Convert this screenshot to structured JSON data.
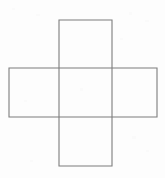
{
  "figure": {
    "background_color": "#fdfdfd",
    "stroke_color": "#7d7d7d",
    "stroke_width": 1.1,
    "canvas": {
      "width": 165,
      "height": 178
    }
  },
  "chart_data": {
    "type": "diagram",
    "title": "",
    "shape": "cross",
    "units": "pixels",
    "shapes": [
      {
        "name": "vertical-bar-rectangle",
        "label": "Vertical arm of cross",
        "x": 59,
        "y": 20,
        "width": 53,
        "height": 146
      },
      {
        "name": "horizontal-bar-rectangle",
        "label": "Horizontal arm of cross",
        "x": 9,
        "y": 68,
        "width": 148,
        "height": 49
      },
      {
        "name": "center-square",
        "label": "Central overlap square",
        "x": 59,
        "y": 68,
        "width": 53,
        "height": 49
      }
    ],
    "intersections": {
      "vertical_lines_x": [
        59,
        112
      ],
      "horizontal_lines_y": [
        68,
        117
      ],
      "top_edge_y": 20,
      "bottom_edge_y": 166,
      "left_edge_x": 9,
      "right_edge_x": 157
    },
    "arms": [
      {
        "name": "top-arm",
        "x": 59,
        "y": 20,
        "width": 53,
        "height": 48
      },
      {
        "name": "left-arm",
        "x": 9,
        "y": 68,
        "width": 50,
        "height": 49
      },
      {
        "name": "right-arm",
        "x": 112,
        "y": 68,
        "width": 45,
        "height": 49
      },
      {
        "name": "bottom-arm",
        "x": 59,
        "y": 117,
        "width": 53,
        "height": 49
      }
    ]
  },
  "speckles": [
    {
      "x": 12,
      "y": 8,
      "w": 3,
      "h": 2
    },
    {
      "x": 36,
      "y": 14,
      "w": 4,
      "h": 2
    },
    {
      "x": 129,
      "y": 12,
      "w": 3,
      "h": 3
    },
    {
      "x": 145,
      "y": 20,
      "w": 4,
      "h": 2
    },
    {
      "x": 120,
      "y": 38,
      "w": 3,
      "h": 2
    },
    {
      "x": 80,
      "y": 88,
      "w": 3,
      "h": 3
    },
    {
      "x": 24,
      "y": 100,
      "w": 3,
      "h": 2
    },
    {
      "x": 132,
      "y": 136,
      "w": 4,
      "h": 3
    },
    {
      "x": 146,
      "y": 150,
      "w": 3,
      "h": 2
    },
    {
      "x": 30,
      "y": 160,
      "w": 3,
      "h": 2
    }
  ]
}
